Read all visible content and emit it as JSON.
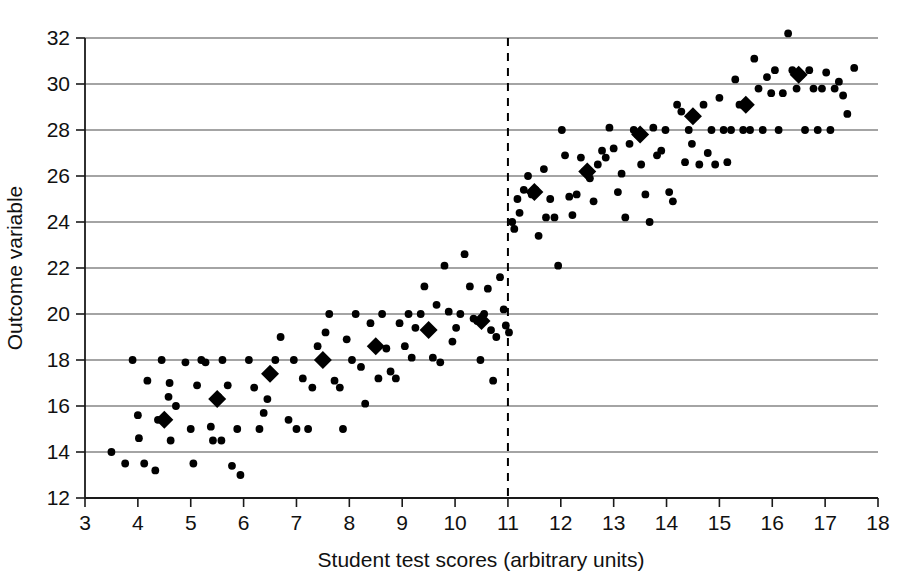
{
  "chart_data": {
    "type": "scatter",
    "title": "",
    "xlabel": "Student test scores (arbitrary units)",
    "ylabel": "Outcome variable",
    "xlim": [
      3,
      18
    ],
    "ylim": [
      12,
      32
    ],
    "xticks": [
      3,
      4,
      5,
      6,
      7,
      8,
      9,
      10,
      11,
      12,
      13,
      14,
      15,
      16,
      17,
      18
    ],
    "yticks": [
      12,
      14,
      16,
      18,
      20,
      22,
      24,
      26,
      28,
      30,
      32
    ],
    "xtick_labels": [
      "3",
      "4",
      "5",
      "6",
      "7",
      "8",
      "9",
      "10",
      "11",
      "12",
      "13",
      "14",
      "15",
      "16",
      "17",
      "18"
    ],
    "ytick_labels": [
      "12",
      "14",
      "16",
      "18",
      "20",
      "22",
      "24",
      "26",
      "28",
      "30",
      "32"
    ],
    "grid": "horizontal",
    "legend": "none",
    "annotations": [
      {
        "name": "cutoff-line",
        "kind": "vertical-dashed-line",
        "x": 11,
        "label": ""
      }
    ],
    "series": [
      {
        "name": "observations",
        "marker": "circle",
        "marker_color": "#000000",
        "points": [
          [
            3.5,
            14.0
          ],
          [
            3.76,
            13.5
          ],
          [
            3.9,
            18.0
          ],
          [
            4.0,
            15.6
          ],
          [
            4.02,
            14.6
          ],
          [
            4.12,
            13.5
          ],
          [
            4.18,
            17.1
          ],
          [
            4.33,
            13.2
          ],
          [
            4.38,
            15.4
          ],
          [
            4.45,
            18.0
          ],
          [
            4.52,
            15.4
          ],
          [
            4.58,
            16.4
          ],
          [
            4.6,
            17.0
          ],
          [
            4.62,
            14.5
          ],
          [
            4.72,
            16.0
          ],
          [
            4.9,
            17.9
          ],
          [
            5.0,
            15.0
          ],
          [
            5.05,
            13.5
          ],
          [
            5.12,
            16.9
          ],
          [
            5.2,
            18.0
          ],
          [
            5.28,
            17.9
          ],
          [
            5.38,
            15.1
          ],
          [
            5.42,
            14.5
          ],
          [
            5.52,
            16.4
          ],
          [
            5.58,
            14.5
          ],
          [
            5.6,
            18.0
          ],
          [
            5.7,
            16.9
          ],
          [
            5.78,
            13.4
          ],
          [
            5.88,
            15.0
          ],
          [
            5.94,
            13.0
          ],
          [
            6.1,
            18.0
          ],
          [
            6.2,
            16.8
          ],
          [
            6.3,
            15.0
          ],
          [
            6.38,
            15.7
          ],
          [
            6.45,
            16.3
          ],
          [
            6.52,
            17.4
          ],
          [
            6.6,
            18.0
          ],
          [
            6.7,
            19.0
          ],
          [
            6.85,
            15.4
          ],
          [
            6.95,
            18.0
          ],
          [
            7.0,
            15.0
          ],
          [
            7.12,
            17.2
          ],
          [
            7.22,
            15.0
          ],
          [
            7.3,
            16.8
          ],
          [
            7.4,
            18.6
          ],
          [
            7.5,
            17.9
          ],
          [
            7.55,
            19.2
          ],
          [
            7.62,
            20.0
          ],
          [
            7.72,
            17.1
          ],
          [
            7.82,
            16.8
          ],
          [
            7.88,
            15.0
          ],
          [
            7.95,
            18.9
          ],
          [
            8.05,
            18.0
          ],
          [
            8.12,
            20.0
          ],
          [
            8.22,
            17.7
          ],
          [
            8.3,
            16.1
          ],
          [
            8.4,
            19.6
          ],
          [
            8.48,
            18.6
          ],
          [
            8.55,
            17.2
          ],
          [
            8.62,
            20.0
          ],
          [
            8.7,
            18.5
          ],
          [
            8.78,
            17.5
          ],
          [
            8.88,
            17.2
          ],
          [
            8.95,
            19.6
          ],
          [
            9.05,
            18.6
          ],
          [
            9.12,
            20.0
          ],
          [
            9.18,
            18.1
          ],
          [
            9.25,
            19.4
          ],
          [
            9.35,
            20.0
          ],
          [
            9.42,
            21.2
          ],
          [
            9.5,
            19.3
          ],
          [
            9.58,
            18.1
          ],
          [
            9.65,
            20.4
          ],
          [
            9.72,
            17.9
          ],
          [
            9.8,
            22.1
          ],
          [
            9.88,
            20.1
          ],
          [
            9.95,
            18.8
          ],
          [
            10.02,
            19.4
          ],
          [
            10.1,
            20.0
          ],
          [
            10.18,
            22.6
          ],
          [
            10.28,
            21.2
          ],
          [
            10.35,
            19.8
          ],
          [
            10.42,
            19.7
          ],
          [
            10.48,
            18.0
          ],
          [
            10.55,
            20.0
          ],
          [
            10.62,
            21.1
          ],
          [
            10.68,
            19.3
          ],
          [
            10.72,
            17.1
          ],
          [
            10.78,
            19.0
          ],
          [
            10.85,
            21.6
          ],
          [
            10.92,
            20.2
          ],
          [
            10.96,
            19.5
          ],
          [
            11.02,
            19.2
          ],
          [
            11.08,
            24.0
          ],
          [
            11.12,
            23.7
          ],
          [
            11.18,
            25.0
          ],
          [
            11.22,
            24.4
          ],
          [
            11.3,
            25.4
          ],
          [
            11.38,
            26.0
          ],
          [
            11.45,
            25.2
          ],
          [
            11.52,
            25.4
          ],
          [
            11.58,
            23.4
          ],
          [
            11.68,
            26.3
          ],
          [
            11.72,
            24.2
          ],
          [
            11.8,
            25.0
          ],
          [
            11.88,
            24.2
          ],
          [
            11.95,
            22.1
          ],
          [
            12.02,
            28.0
          ],
          [
            12.08,
            26.9
          ],
          [
            12.16,
            25.1
          ],
          [
            12.22,
            24.3
          ],
          [
            12.3,
            25.2
          ],
          [
            12.38,
            26.8
          ],
          [
            12.45,
            26.2
          ],
          [
            12.55,
            25.9
          ],
          [
            12.62,
            24.9
          ],
          [
            12.7,
            26.5
          ],
          [
            12.78,
            27.1
          ],
          [
            12.85,
            26.8
          ],
          [
            12.92,
            28.1
          ],
          [
            13.0,
            27.2
          ],
          [
            13.08,
            25.3
          ],
          [
            13.15,
            26.1
          ],
          [
            13.22,
            24.2
          ],
          [
            13.3,
            27.4
          ],
          [
            13.38,
            28.0
          ],
          [
            13.45,
            27.8
          ],
          [
            13.52,
            26.5
          ],
          [
            13.6,
            25.2
          ],
          [
            13.68,
            24.0
          ],
          [
            13.75,
            28.1
          ],
          [
            13.82,
            26.9
          ],
          [
            13.9,
            27.1
          ],
          [
            13.98,
            28.0
          ],
          [
            14.05,
            25.3
          ],
          [
            14.12,
            24.9
          ],
          [
            14.2,
            29.1
          ],
          [
            14.28,
            28.8
          ],
          [
            14.35,
            26.6
          ],
          [
            14.42,
            28.0
          ],
          [
            14.48,
            27.4
          ],
          [
            14.55,
            28.6
          ],
          [
            14.62,
            26.5
          ],
          [
            14.7,
            29.1
          ],
          [
            14.78,
            27.0
          ],
          [
            14.85,
            28.0
          ],
          [
            14.92,
            26.5
          ],
          [
            15.0,
            29.4
          ],
          [
            15.08,
            28.0
          ],
          [
            15.15,
            26.6
          ],
          [
            15.22,
            28.0
          ],
          [
            15.3,
            30.2
          ],
          [
            15.38,
            29.1
          ],
          [
            15.45,
            28.0
          ],
          [
            15.52,
            29.1
          ],
          [
            15.58,
            28.0
          ],
          [
            15.66,
            31.1
          ],
          [
            15.74,
            29.8
          ],
          [
            15.82,
            28.0
          ],
          [
            15.9,
            30.3
          ],
          [
            15.98,
            29.6
          ],
          [
            16.05,
            30.6
          ],
          [
            16.12,
            28.0
          ],
          [
            16.2,
            29.6
          ],
          [
            16.3,
            32.2
          ],
          [
            16.38,
            30.6
          ],
          [
            16.46,
            29.8
          ],
          [
            16.55,
            30.4
          ],
          [
            16.62,
            28.0
          ],
          [
            16.7,
            30.6
          ],
          [
            16.78,
            29.8
          ],
          [
            16.86,
            28.0
          ],
          [
            16.94,
            29.8
          ],
          [
            17.02,
            30.5
          ],
          [
            17.1,
            28.0
          ],
          [
            17.18,
            29.8
          ],
          [
            17.26,
            30.1
          ],
          [
            17.34,
            29.5
          ],
          [
            17.42,
            28.7
          ],
          [
            17.55,
            30.7
          ]
        ]
      },
      {
        "name": "bin-means",
        "marker": "diamond",
        "marker_color": "#000000",
        "points": [
          [
            4.5,
            15.4
          ],
          [
            5.5,
            16.3
          ],
          [
            6.5,
            17.4
          ],
          [
            7.5,
            18.0
          ],
          [
            8.5,
            18.6
          ],
          [
            9.5,
            19.3
          ],
          [
            10.5,
            19.7
          ],
          [
            11.5,
            25.3
          ],
          [
            12.5,
            26.2
          ],
          [
            13.5,
            27.8
          ],
          [
            14.5,
            28.6
          ],
          [
            15.5,
            29.1
          ],
          [
            16.5,
            30.4
          ]
        ]
      }
    ]
  }
}
